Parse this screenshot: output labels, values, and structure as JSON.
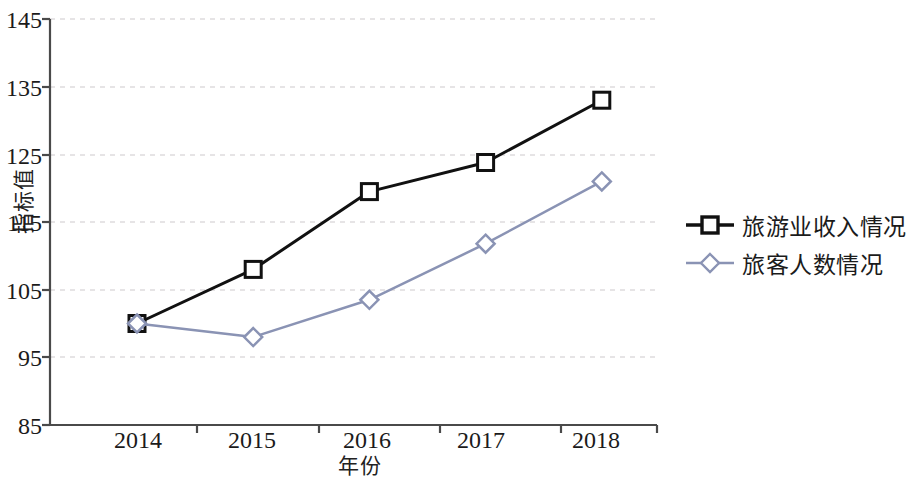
{
  "chart_data": {
    "type": "line",
    "title": "",
    "subtitle": "",
    "xlabel": "年份",
    "ylabel": "指标值",
    "categories": [
      "2014",
      "2015",
      "2016",
      "2017",
      "2018"
    ],
    "x": [
      2014,
      2015,
      2016,
      2017,
      2018
    ],
    "ylim": [
      85,
      145
    ],
    "xlim": [
      2013.5,
      2018.5
    ],
    "y_ticks": [
      85,
      95,
      105,
      115,
      125,
      135,
      145
    ],
    "grid": "horizontal-dashed",
    "legend_position": "right",
    "series": [
      {
        "name": "旅游业收入情况",
        "values": [
          100.0,
          108.0,
          119.5,
          123.8,
          133.0
        ],
        "color": "#111111",
        "marker": "square",
        "marker_fill": "#ffffff",
        "line_width": 3
      },
      {
        "name": "旅客人数情况",
        "values": [
          100.0,
          98.0,
          103.5,
          111.8,
          121.0
        ],
        "color": "#8a93b4",
        "marker": "diamond",
        "marker_fill": "#ffffff",
        "line_width": 2.5
      }
    ]
  },
  "axes": {
    "y_tick_labels": [
      "145",
      "135",
      "125",
      "115",
      "105",
      "95",
      "85"
    ],
    "x_tick_labels": [
      "2014",
      "2015",
      "2016",
      "2017",
      "2018"
    ],
    "y_title": "指标值",
    "x_title": "年份",
    "axis_color": "#4a4a4a",
    "grid_color": "#cdc9cc"
  },
  "legend": {
    "items": [
      {
        "label": "旅游业收入情况",
        "marker": "square-marker",
        "color": "#111111"
      },
      {
        "label": "旅客人数情况",
        "marker": "diamond-marker",
        "color": "#8a93b4"
      }
    ]
  }
}
